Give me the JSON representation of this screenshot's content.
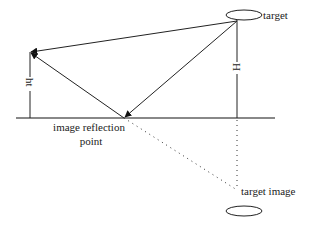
{
  "diagram": {
    "labels": {
      "target": "target",
      "target_image": "target image",
      "reflection_line1": "image reflection",
      "reflection_line2": "point",
      "receiver_height": "ht",
      "target_height": "H"
    },
    "colors": {
      "stroke": "#222222",
      "ground": "#888888",
      "background": "#ffffff"
    },
    "points": {
      "receiver": [
        30,
        52
      ],
      "target": [
        237,
        20
      ],
      "reflection": [
        124,
        118
      ],
      "target_image": [
        237,
        190
      ]
    }
  }
}
